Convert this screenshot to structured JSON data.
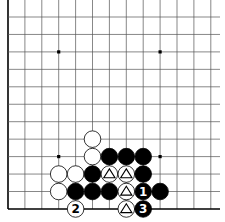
{
  "diagram": {
    "type": "go-board-fragment",
    "view": "lower-left corner region",
    "columns": 13,
    "rows": 12,
    "edges": {
      "left": true,
      "bottom": true,
      "top": false,
      "right": false
    },
    "star_points": [
      {
        "col": 3,
        "row": 2
      },
      {
        "col": 9,
        "row": 2
      },
      {
        "col": 3,
        "row": 8
      },
      {
        "col": 9,
        "row": 8
      }
    ],
    "stones": [
      {
        "col": 5,
        "row": 7,
        "color": "white"
      },
      {
        "col": 5,
        "row": 8,
        "color": "white"
      },
      {
        "col": 6,
        "row": 8,
        "color": "black"
      },
      {
        "col": 7,
        "row": 8,
        "color": "black"
      },
      {
        "col": 8,
        "row": 8,
        "color": "black"
      },
      {
        "col": 3,
        "row": 9,
        "color": "white"
      },
      {
        "col": 4,
        "row": 9,
        "color": "white"
      },
      {
        "col": 5,
        "row": 9,
        "color": "black"
      },
      {
        "col": 6,
        "row": 9,
        "color": "white",
        "mark": "triangle"
      },
      {
        "col": 7,
        "row": 9,
        "color": "white",
        "mark": "triangle"
      },
      {
        "col": 8,
        "row": 9,
        "color": "black"
      },
      {
        "col": 3,
        "row": 10,
        "color": "white"
      },
      {
        "col": 4,
        "row": 10,
        "color": "black"
      },
      {
        "col": 5,
        "row": 10,
        "color": "black"
      },
      {
        "col": 6,
        "row": 10,
        "color": "black"
      },
      {
        "col": 7,
        "row": 10,
        "color": "white",
        "mark": "triangle"
      },
      {
        "col": 8,
        "row": 10,
        "color": "black",
        "label": "1"
      },
      {
        "col": 9,
        "row": 10,
        "color": "black"
      },
      {
        "col": 4,
        "row": 11,
        "color": "white",
        "label": "2"
      },
      {
        "col": 7,
        "row": 11,
        "color": "white",
        "mark": "triangle"
      },
      {
        "col": 8,
        "row": 11,
        "color": "black",
        "label": "3"
      }
    ],
    "colors": {
      "background": "#ffffff",
      "grid": "#555555",
      "edge": "#000000",
      "black_stone": "#000000",
      "white_stone": "#ffffff",
      "stone_outline": "#000000"
    }
  }
}
